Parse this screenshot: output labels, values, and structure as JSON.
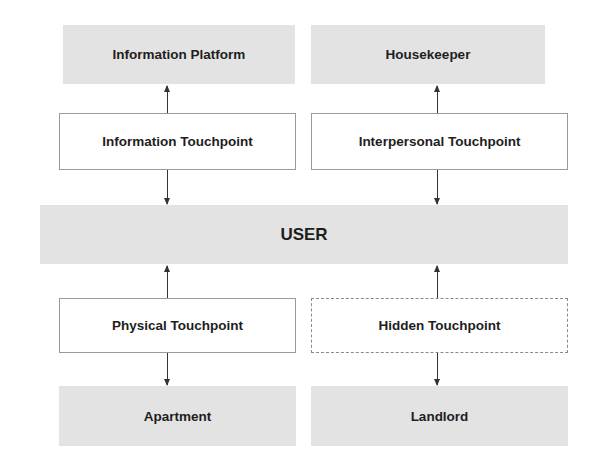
{
  "diagram": {
    "center": {
      "label": "USER"
    },
    "top_left": {
      "entity": "Information Platform",
      "touchpoint": "Information Touchpoint"
    },
    "top_right": {
      "entity": "Housekeeper",
      "touchpoint": "Interpersonal Touchpoint"
    },
    "bottom_left": {
      "touchpoint": "Physical Touchpoint",
      "entity": "Apartment"
    },
    "bottom_right": {
      "touchpoint": "Hidden Touchpoint",
      "entity": "Landlord",
      "touchpoint_border": "dashed"
    },
    "colors": {
      "entity_fill": "#e3e3e3",
      "touchpoint_fill": "#ffffff",
      "border": "#9a9a9a",
      "arrow": "#333333",
      "text": "#1e1e1e"
    }
  }
}
